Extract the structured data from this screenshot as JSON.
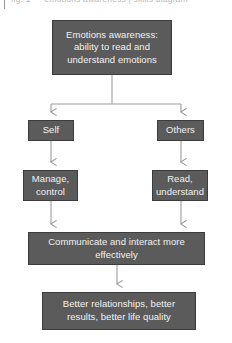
{
  "page": {
    "clipped_caption": "fig. 1 — emotions awareness | skills diagram",
    "background_color": "#ffffff"
  },
  "diagram": {
    "type": "flowchart",
    "node_fill_color": "#5b5b5b",
    "node_border_color": "#3c3c3c",
    "node_text_color": "#f2f2f2",
    "connector_color": "#9b9b9b",
    "nodes": [
      {
        "id": "root",
        "lines": [
          "Emotions awareness:",
          "ability to read and",
          "understand emotions"
        ]
      },
      {
        "id": "self",
        "lines": [
          "Self"
        ]
      },
      {
        "id": "others",
        "lines": [
          "Others"
        ]
      },
      {
        "id": "manage",
        "lines": [
          "Manage,",
          "control"
        ]
      },
      {
        "id": "read",
        "lines": [
          "Read,",
          "understand"
        ]
      },
      {
        "id": "communicate",
        "lines": [
          "Communicate and interact more",
          "effectively"
        ]
      },
      {
        "id": "outcome",
        "lines": [
          "Better relationships, better",
          "results, better life quality"
        ]
      }
    ],
    "edges": [
      {
        "from": "root",
        "to": "self",
        "style": "elbow-arrow"
      },
      {
        "from": "root",
        "to": "others",
        "style": "elbow-arrow"
      },
      {
        "from": "self",
        "to": "manage",
        "style": "straight-arrow"
      },
      {
        "from": "others",
        "to": "read",
        "style": "straight-arrow"
      },
      {
        "from": "manage",
        "to": "communicate",
        "style": "straight-arrow"
      },
      {
        "from": "read",
        "to": "communicate",
        "style": "straight-arrow"
      },
      {
        "from": "communicate",
        "to": "outcome",
        "style": "straight-arrow"
      }
    ]
  }
}
